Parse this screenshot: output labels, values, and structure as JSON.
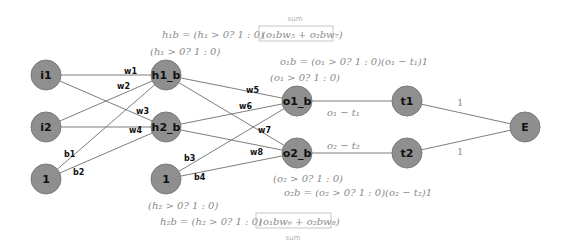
{
  "diagram": {
    "colors": {
      "node_fill": "#8f8f8f",
      "node_stroke": "#7a7a7a",
      "edge": "#6e6e6e",
      "math_text": "#8a8a8a",
      "sum_box": "#b8b8b8"
    },
    "nodes": {
      "i1": "i1",
      "i2": "i2",
      "bias_in": "1",
      "h1": "h1_b",
      "h2": "h2_b",
      "bias_hidden": "1",
      "o1": "o1_b",
      "o2": "o2_b",
      "t1": "t1",
      "t2": "t2",
      "E": "E"
    },
    "edge_labels": {
      "w1": "w1",
      "w2": "w2",
      "w3": "w3",
      "w4": "w4",
      "b1": "b1",
      "b2": "b2",
      "w5": "w5",
      "w6": "w6",
      "w7": "w7",
      "w8": "w8",
      "b3": "b3",
      "b4": "b4",
      "o1_t1": "o₁ − t₁",
      "o2_t2": "o₂ − t₂",
      "t1_E": "1",
      "t2_E": "1"
    },
    "annotations": {
      "h1b_eq_lhs": "h₁b = (h₁ > 0? 1 : 0)",
      "h1b_eq_sum": "(o₁bw₅ + o₂bw₇)",
      "h1b_sum_label": "sum",
      "h1_cond": "(h₁ > 0? 1 : 0)",
      "o1b_eq": "o₁b = (o₁ > 0? 1 : 0)(o₁ − t₁)1",
      "o1_cond": "(o₁ > 0? 1 : 0)",
      "o2_cond": "(o₂ > 0? 1 : 0)",
      "o2b_eq": "o₂b = (o₂ > 0? 1 : 0)(o₂ − t₂)1",
      "h2_cond": "(h₂ > 0? 1 : 0)",
      "h2b_eq_lhs": "h₂b = (h₂ > 0? 1 : 0)",
      "h2b_eq_sum": "(o₁bw₆ + o₂bw₈)",
      "h2b_sum_label": "sum"
    }
  }
}
